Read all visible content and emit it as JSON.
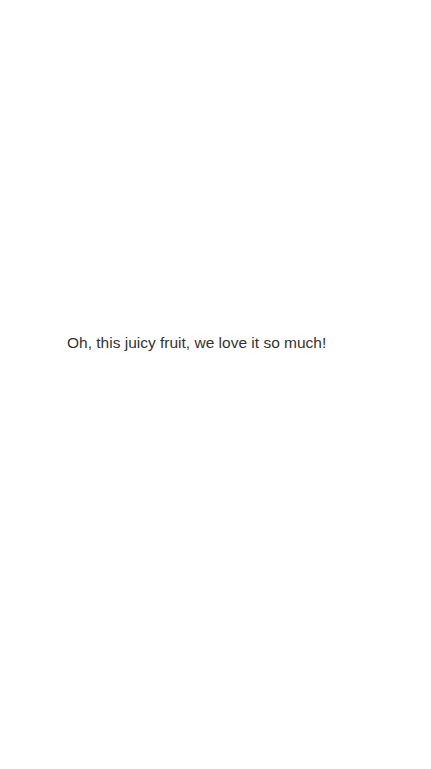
{
  "screen": {
    "background_color": "#ffffff"
  },
  "content": {
    "message": "Oh, this juicy fruit, we love it so much!",
    "text_color": "#333333"
  }
}
